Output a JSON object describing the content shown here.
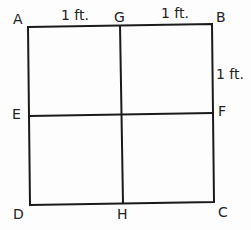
{
  "diagram": {
    "type": "square divided into four equal squares",
    "vertices": {
      "A": "A",
      "B": "B",
      "C": "C",
      "D": "D",
      "E": "E",
      "F": "F",
      "G": "G",
      "H": "H"
    },
    "dimensions": {
      "AG": "1 ft.",
      "GB": "1 ft.",
      "BF": "1 ft."
    },
    "colors": {
      "line": "#1a1a1a",
      "background": "#fdfdfd"
    }
  }
}
